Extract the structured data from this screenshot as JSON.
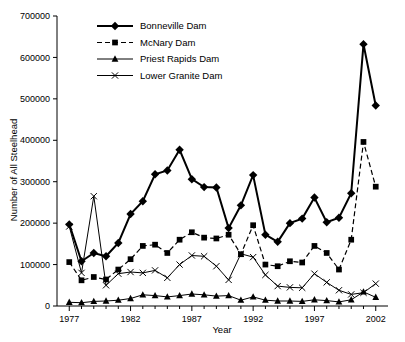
{
  "chart_data": {
    "type": "line",
    "title": "",
    "xlabel": "Year",
    "ylabel": "Number of All Steelhead",
    "xlim": [
      1976,
      2003
    ],
    "ylim": [
      0,
      700000
    ],
    "xticks": [
      1977,
      1982,
      1987,
      1992,
      1997,
      2002
    ],
    "yticks": [
      0,
      100000,
      200000,
      300000,
      400000,
      500000,
      600000,
      700000
    ],
    "grid": false,
    "legend_position": "top-left",
    "x": [
      1977,
      1978,
      1979,
      1980,
      1981,
      1982,
      1983,
      1984,
      1985,
      1986,
      1987,
      1988,
      1989,
      1990,
      1991,
      1992,
      1993,
      1994,
      1995,
      1996,
      1997,
      1998,
      1999,
      2000,
      2001,
      2002
    ],
    "series": [
      {
        "name": "Bonneville Dam",
        "marker": "filled-diamond",
        "linestyle": "solid",
        "values": [
          197000,
          108000,
          128000,
          120000,
          152000,
          222000,
          253000,
          318000,
          327000,
          377000,
          306000,
          287000,
          286000,
          188000,
          243000,
          316000,
          172000,
          155000,
          200000,
          211000,
          262000,
          202000,
          213000,
          272000,
          632000,
          484000
        ]
      },
      {
        "name": "McNary Dam",
        "marker": "filled-square",
        "linestyle": "dashed",
        "values": [
          106000,
          62000,
          70000,
          64000,
          88000,
          113000,
          145000,
          148000,
          128000,
          160000,
          178000,
          165000,
          163000,
          172000,
          125000,
          195000,
          100000,
          96000,
          108000,
          105000,
          145000,
          128000,
          88000,
          160000,
          396000,
          288000
        ]
      },
      {
        "name": "Priest Rapids Dam",
        "marker": "filled-triangle",
        "linestyle": "solid",
        "values": [
          9000,
          8000,
          11000,
          12000,
          14000,
          18000,
          27000,
          25000,
          22000,
          25000,
          29000,
          27000,
          24000,
          25000,
          14000,
          22000,
          14000,
          12000,
          12000,
          11000,
          15000,
          13000,
          10000,
          15000,
          34000,
          21000
        ]
      },
      {
        "name": "Lower Granite Dam",
        "marker": "cross",
        "linestyle": "solid",
        "values": [
          192000,
          80000,
          265000,
          50000,
          78000,
          82000,
          80000,
          86000,
          68000,
          100000,
          122000,
          120000,
          96000,
          63000,
          126000,
          118000,
          75000,
          48000,
          45000,
          44000,
          78000,
          57000,
          38000,
          28000,
          32000,
          54000
        ]
      }
    ]
  },
  "legend": {
    "items": [
      {
        "label": "Bonneville Dam"
      },
      {
        "label": "McNary Dam"
      },
      {
        "label": "Priest Rapids Dam"
      },
      {
        "label": "Lower Granite Dam"
      }
    ]
  },
  "axes": {
    "y_title": "Number of All Steelhead",
    "x_title": "Year",
    "y_tick_labels": [
      "0",
      "100000",
      "200000",
      "300000",
      "400000",
      "500000",
      "600000",
      "700000"
    ],
    "x_tick_labels": [
      "1977",
      "1982",
      "1987",
      "1992",
      "1997",
      "2002"
    ]
  }
}
